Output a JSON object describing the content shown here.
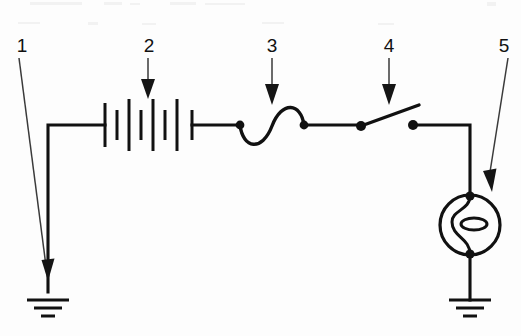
{
  "figure": {
    "kind": "electrical-circuit-schematic",
    "background_color": "#fdfdfd",
    "ink_color": "#111111",
    "width": 521,
    "height": 336
  },
  "callouts": [
    {
      "id": "1",
      "label": "1",
      "target": "ground-symbol-left",
      "label_x": 22,
      "label_y": 48,
      "tip_x": 48,
      "tip_y": 280
    },
    {
      "id": "2",
      "label": "2",
      "target": "battery-symbol",
      "label_x": 149,
      "label_y": 48,
      "tip_x": 148,
      "tip_y": 99
    },
    {
      "id": "3",
      "label": "3",
      "target": "fuse-symbol",
      "label_x": 272,
      "label_y": 48,
      "tip_x": 272,
      "tip_y": 105
    },
    {
      "id": "4",
      "label": "4",
      "target": "switch-symbol",
      "label_x": 389,
      "label_y": 48,
      "tip_x": 389,
      "tip_y": 105
    },
    {
      "id": "5",
      "label": "5",
      "target": "lamp-symbol",
      "label_x": 504,
      "label_y": 48,
      "tip_x": 492,
      "tip_y": 192
    }
  ],
  "components": {
    "ground_left": {
      "name": "ground-symbol-left",
      "x": 48,
      "y": 292,
      "bars": 3
    },
    "battery": {
      "name": "battery-symbol",
      "x": 148,
      "y": 125,
      "cells": 6
    },
    "fuse": {
      "name": "fuse-symbol",
      "x": 272,
      "y": 125
    },
    "switch": {
      "name": "switch-symbol",
      "x": 380,
      "y": 125,
      "state": "open"
    },
    "lamp": {
      "name": "lamp-symbol",
      "x": 470,
      "y": 225,
      "radius": 30
    },
    "ground_right": {
      "name": "ground-symbol-right",
      "x": 470,
      "y": 300,
      "bars": 3
    }
  },
  "wires": {
    "left_vertical": "from ground-symbol-left up to main rail",
    "main_rail": "battery through fuse and switch to lamp branch",
    "right_vertical": "switch terminal down into lamp, lamp down to ground-symbol-right"
  }
}
